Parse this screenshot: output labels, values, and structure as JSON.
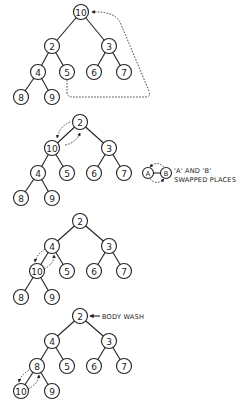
{
  "diagram": {
    "node_radius": 7.5,
    "stroke_color": "#222222",
    "background": "#ffffff",
    "trees": [
      {
        "id": "step-1",
        "nodes": {
          "root": {
            "label": "10",
            "x": 81,
            "y": 12
          },
          "l": {
            "label": "2",
            "x": 52,
            "y": 46
          },
          "r": {
            "label": "3",
            "x": 109,
            "y": 46
          },
          "ll": {
            "label": "4",
            "x": 38,
            "y": 72
          },
          "lr": {
            "label": "5",
            "x": 67,
            "y": 72
          },
          "rl": {
            "label": "6",
            "x": 94,
            "y": 72
          },
          "rr": {
            "label": "7",
            "x": 124,
            "y": 72
          },
          "lll": {
            "label": "8",
            "x": 21,
            "y": 97
          },
          "llr": {
            "label": "9",
            "x": 52,
            "y": 97
          }
        },
        "annotation": "last element 5 moved to root position (dashed arrow)"
      },
      {
        "id": "step-2",
        "nodes": {
          "root": {
            "label": "2",
            "x": 80,
            "y": 122
          },
          "l": {
            "label": "10",
            "x": 52,
            "y": 148
          },
          "r": {
            "label": "3",
            "x": 109,
            "y": 148
          },
          "ll": {
            "label": "4",
            "x": 38,
            "y": 173
          },
          "lr": {
            "label": "5",
            "x": 67,
            "y": 173
          },
          "rl": {
            "label": "6",
            "x": 94,
            "y": 173
          },
          "rr": {
            "label": "7",
            "x": 124,
            "y": 173
          },
          "lll": {
            "label": "8",
            "x": 21,
            "y": 198
          },
          "llr": {
            "label": "9",
            "x": 52,
            "y": 198
          }
        },
        "swap": [
          "root",
          "l"
        ]
      },
      {
        "id": "step-3",
        "nodes": {
          "root": {
            "label": "2",
            "x": 80,
            "y": 221
          },
          "l": {
            "label": "4",
            "x": 52,
            "y": 246
          },
          "r": {
            "label": "3",
            "x": 109,
            "y": 246
          },
          "ll": {
            "label": "10",
            "x": 37,
            "y": 271
          },
          "lr": {
            "label": "5",
            "x": 67,
            "y": 271
          },
          "rl": {
            "label": "6",
            "x": 94,
            "y": 271
          },
          "rr": {
            "label": "7",
            "x": 124,
            "y": 271
          },
          "lll": {
            "label": "8",
            "x": 21,
            "y": 297
          },
          "llr": {
            "label": "9",
            "x": 52,
            "y": 297
          }
        },
        "swap": [
          "l",
          "ll"
        ]
      },
      {
        "id": "step-4",
        "nodes": {
          "root": {
            "label": "2",
            "x": 80,
            "y": 316
          },
          "l": {
            "label": "4",
            "x": 52,
            "y": 341
          },
          "r": {
            "label": "3",
            "x": 109,
            "y": 341
          },
          "ll": {
            "label": "8",
            "x": 37,
            "y": 366
          },
          "lr": {
            "label": "5",
            "x": 67,
            "y": 366
          },
          "rl": {
            "label": "6",
            "x": 94,
            "y": 366
          },
          "rr": {
            "label": "7",
            "x": 124,
            "y": 366
          },
          "lll": {
            "label": "10",
            "x": 21,
            "y": 391
          },
          "llr": {
            "label": "9",
            "x": 52,
            "y": 391
          }
        },
        "swap": [
          "ll",
          "lll"
        ]
      }
    ],
    "legend": {
      "node_a": "A",
      "node_b": "B",
      "line1": "'A' AND 'B'",
      "line2": "SWAPPED PLACES"
    },
    "callout": {
      "text": "BODY WASH",
      "arrow": "left-arrow"
    }
  }
}
